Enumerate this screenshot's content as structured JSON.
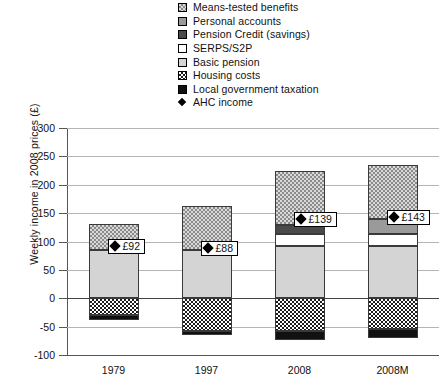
{
  "chart_data": {
    "type": "bar",
    "stacked": true,
    "title": "",
    "xlabel": "",
    "ylabel": "Weekly income in 2008 prices (£)",
    "ylim": [
      -100,
      300
    ],
    "yticks": [
      300,
      250,
      200,
      150,
      100,
      50,
      0,
      -50,
      -100
    ],
    "ytick_labels": [
      "300",
      "250",
      "200",
      "150",
      "100",
      "50",
      "0",
      "-50",
      "-100"
    ],
    "grid": true,
    "legend_position": "top",
    "categories": [
      "1979",
      "1997",
      "2008",
      "2008M"
    ],
    "series": [
      {
        "name": "Means-tested benefits",
        "key": "means",
        "swatch": "fill-means",
        "values": [
          45,
          77,
          95,
          95
        ]
      },
      {
        "name": "Personal accounts",
        "key": "personal",
        "swatch": "fill-personal",
        "values": [
          0,
          0,
          0,
          25
        ]
      },
      {
        "name": "Pension Credit (savings)",
        "key": "pensioncredit",
        "swatch": "fill-pensioncredit",
        "values": [
          0,
          0,
          15,
          0
        ]
      },
      {
        "name": "SERPS/S2P",
        "key": "serps",
        "swatch": "fill-serps",
        "values": [
          0,
          0,
          22,
          22
        ]
      },
      {
        "name": "Basic pension",
        "key": "basic",
        "swatch": "fill-basic",
        "values": [
          85,
          85,
          92,
          92
        ]
      },
      {
        "name": "Housing costs",
        "key": "housing",
        "swatch": "fill-housing",
        "values": [
          -30,
          -57,
          -58,
          -55
        ]
      },
      {
        "name": "Local government taxation",
        "key": "localtax",
        "swatch": "fill-localtax",
        "values": [
          -8,
          -8,
          -15,
          -15
        ]
      }
    ],
    "marker_series": {
      "name": "AHC income",
      "marker": "diamond",
      "values": [
        92,
        88,
        139,
        143
      ],
      "labels": [
        "£92",
        "£88",
        "£139",
        "£143"
      ]
    }
  },
  "legend": {
    "items": [
      {
        "label": "Means-tested benefits"
      },
      {
        "label": "Personal accounts"
      },
      {
        "label": "Pension Credit (savings)"
      },
      {
        "label": "SERPS/S2P"
      },
      {
        "label": "Basic pension"
      },
      {
        "label": "Housing costs"
      },
      {
        "label": "Local government taxation"
      },
      {
        "label": "AHC income"
      }
    ]
  },
  "colors": {
    "means": "#d9d9d9",
    "personal": "#9a9a9a",
    "pension_credit": "#4a4a4a",
    "serps": "#ffffff",
    "basic_pension": "#d4d4d4",
    "housing": "#ffffff",
    "local_tax": "#111111",
    "gridline": "#b4b4b4",
    "axis": "#555555"
  }
}
